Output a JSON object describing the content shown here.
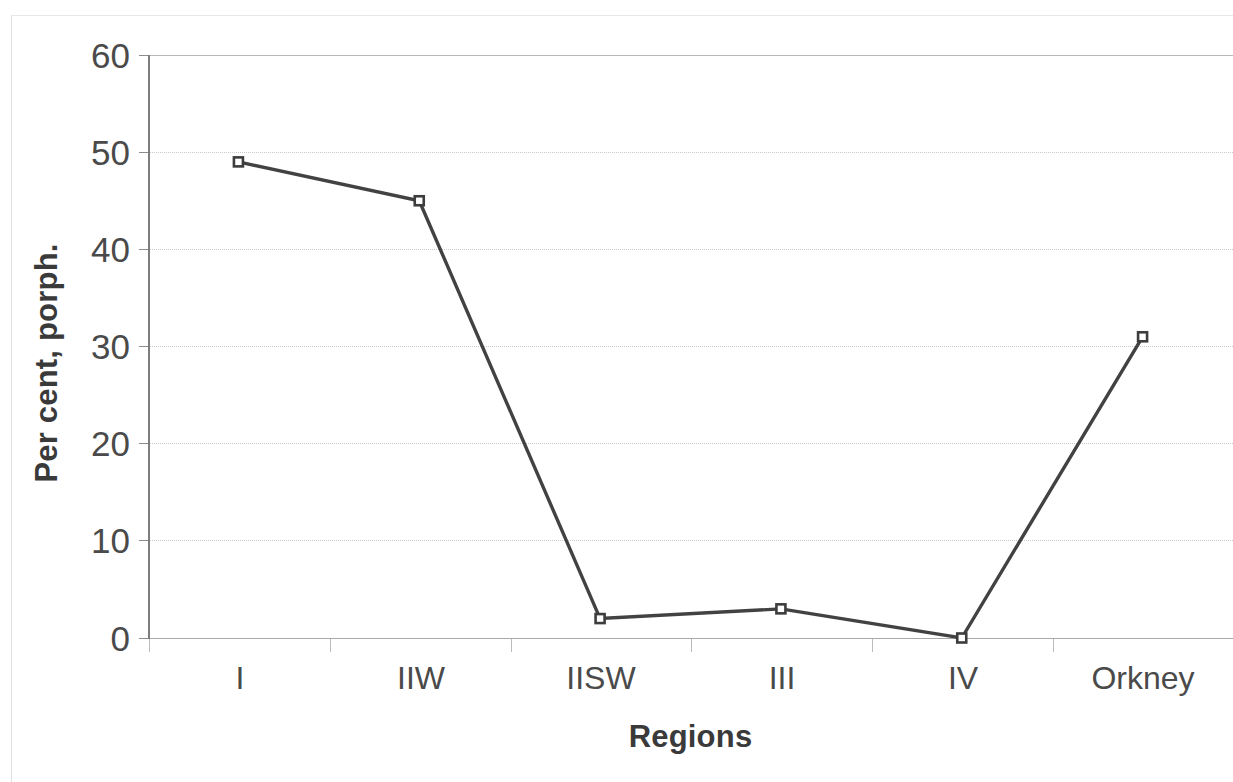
{
  "chart_data": {
    "type": "line",
    "title": "",
    "subtitle": "",
    "categories": [
      "I",
      "IIW",
      "IISW",
      "III",
      "IV",
      "Orkney"
    ],
    "values": [
      49,
      45,
      2,
      3,
      0,
      31
    ],
    "series": [
      {
        "name": "Per cent, porph.",
        "values": [
          49,
          45,
          2,
          3,
          0,
          31
        ]
      }
    ],
    "xlabel": "Regions",
    "ylabel": "Per cent, porph.",
    "ylim": [
      0,
      60
    ],
    "yticks": [
      0,
      10,
      20,
      30,
      40,
      50,
      60
    ],
    "ytick_labels": [
      "0",
      "10",
      "20",
      "30",
      "40",
      "50",
      "60"
    ],
    "grid": true,
    "grid_axis": "y",
    "legend": false,
    "legend_position": "none",
    "marker": "open-square",
    "line_color": "#424242",
    "marker_fill": "#ffffff",
    "marker_edge_color": "#3d3d3d",
    "grid_color": "#c9c9c9",
    "axis_color": "#7d7d7d",
    "text_color": "#4a4a4a"
  },
  "axes": {
    "y_title": "Per cent, porph.",
    "x_title": "Regions"
  }
}
